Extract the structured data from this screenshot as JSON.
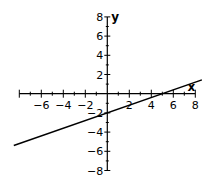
{
  "chart_data": {
    "type": "line",
    "title": "",
    "xlabel": "x",
    "ylabel": "y",
    "xlim": [
      -8,
      8
    ],
    "ylim": [
      -8,
      8
    ],
    "grid": false,
    "legend": null,
    "x_ticks": [
      -6,
      -4,
      -2,
      2,
      4,
      6,
      8
    ],
    "y_ticks": [
      -8,
      -6,
      -4,
      -2,
      2,
      4,
      6,
      8
    ],
    "x_tick_labels": [
      "−6",
      "−4",
      "−2",
      "2",
      "4",
      "6",
      "8"
    ],
    "y_tick_labels": [
      "−8",
      "−6",
      "−4",
      "−2",
      "2",
      "4",
      "6",
      "8"
    ],
    "series": [
      {
        "name": "y = 0.4x − 2",
        "equation": "y = 0.4x - 2",
        "slope": 0.4,
        "y_intercept": -2,
        "x_intercept": 5,
        "x": [
          -8.5,
          8.6
        ],
        "values": [
          -5.4,
          1.44
        ],
        "color": "#000000"
      }
    ]
  },
  "layout": {
    "origin_px": [
      107.3,
      93.7
    ],
    "x_scale_px": 11,
    "y_scale_px": 9.6,
    "line_color": "#000000",
    "axis_color": "#000000"
  }
}
